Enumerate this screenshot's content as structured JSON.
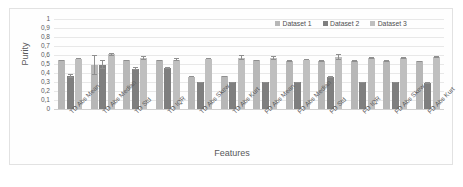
{
  "chart_data": {
    "type": "bar",
    "title": "",
    "xlabel": "Features",
    "ylabel": "Purity",
    "ylim": [
      0,
      1
    ],
    "ytick_labels": [
      "1",
      "0,9",
      "0,8",
      "0,7",
      "0,6",
      "0,5",
      "0,4",
      "0,3",
      "0,2",
      "0,1",
      "0"
    ],
    "ytick_values": [
      1,
      0.9,
      0.8,
      0.7,
      0.6,
      0.5,
      0.4,
      0.3,
      0.2,
      0.1,
      0
    ],
    "grid": true,
    "legend_position": "top-right",
    "categories": [
      "TD Abs Mean",
      "TD Abs Median",
      "TD Std",
      "TD IQR",
      "TD Abs Skew",
      "TD Abs Kurt",
      "FD Abs Mean",
      "FD Abs Median",
      "FD Std",
      "FD IQR",
      "FD Abs Skew",
      "FD Abs Kurt"
    ],
    "series": [
      {
        "name": "Dataset 1",
        "color": "#b7b7b7",
        "values": [
          0.54,
          0.49,
          0.54,
          0.54,
          0.36,
          0.365,
          0.54,
          0.535,
          0.535,
          0.535,
          0.535,
          0.53
        ],
        "errors": [
          0.005,
          0.11,
          0.005,
          0.004,
          0.004,
          0.004,
          0.004,
          0.004,
          0.004,
          0.004,
          0.004,
          0.004
        ]
      },
      {
        "name": "Dataset 2",
        "color": "#7f7f7f",
        "values": [
          0.37,
          0.49,
          0.45,
          0.455,
          0.295,
          0.295,
          0.295,
          0.295,
          0.355,
          0.295,
          0.295,
          0.29
        ],
        "errors": [
          0.022,
          0.05,
          0.018,
          0.012,
          0.005,
          0.005,
          0.004,
          0.004,
          0.012,
          0.004,
          0.004,
          0.004
        ]
      },
      {
        "name": "Dataset 3",
        "color": "#bfbfbf",
        "values": [
          0.56,
          0.61,
          0.565,
          0.55,
          0.56,
          0.57,
          0.57,
          0.55,
          0.58,
          0.57,
          0.57,
          0.575
        ],
        "errors": [
          0.008,
          0.018,
          0.025,
          0.015,
          0.006,
          0.025,
          0.022,
          0.008,
          0.03,
          0.012,
          0.012,
          0.01
        ]
      }
    ]
  },
  "legend": {
    "items": [
      {
        "label": "Dataset 1"
      },
      {
        "label": "Dataset 2"
      },
      {
        "label": "Dataset 3"
      }
    ]
  }
}
